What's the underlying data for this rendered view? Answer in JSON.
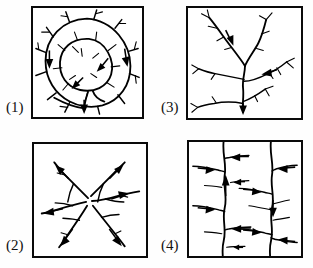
{
  "figure": {
    "background_color": "#fefefe",
    "ink_color": "#000000",
    "border_color": "#0a0a0a",
    "panel_count": 4,
    "layout": "2x2 grid, label to the left of each framed box"
  },
  "panels": [
    {
      "id": "panel-1",
      "label": "(1)",
      "pattern": "annular",
      "description": "Concentric ring-shaped streams with short radiating barbed tributaries, outlet at bottom",
      "grid_position": "top-left",
      "flow_arrow_count": 4
    },
    {
      "id": "panel-2",
      "label": "(2)",
      "pattern": "radial",
      "description": "Streams diverging outward in all directions from a central high point",
      "grid_position": "bottom-left",
      "flow_arrow_count": 5
    },
    {
      "id": "panel-3",
      "label": "(3)",
      "pattern": "dendritic",
      "description": "Tree-like branching network with a central trunk draining to the bottom",
      "grid_position": "top-right",
      "flow_arrow_count": 3
    },
    {
      "id": "panel-4",
      "label": "(4)",
      "pattern": "trellis",
      "description": "Parallel wavy main streams joined at right angles by short tributaries",
      "grid_position": "bottom-right",
      "flow_arrow_count": 12
    }
  ]
}
